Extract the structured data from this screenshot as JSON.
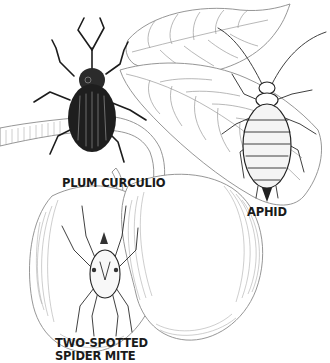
{
  "illustration": {
    "subject": "Plum pests",
    "style": "black-and-white pen illustration",
    "colors": {
      "background": "#ffffff",
      "ink": "#1c1c1c",
      "line_art": "#8a8a8a"
    }
  },
  "labels": {
    "plum_curculio": "PLUM CURCULIO",
    "aphid": "APHID",
    "spider_mite_line1": "TWO-SPOTTED",
    "spider_mite_line2": "SPIDER MITE"
  },
  "elements": {
    "insects": [
      "plum curculio",
      "aphid",
      "two-spotted spider mite"
    ],
    "plants": [
      "plum leaves",
      "branch stem",
      "two plums"
    ]
  }
}
